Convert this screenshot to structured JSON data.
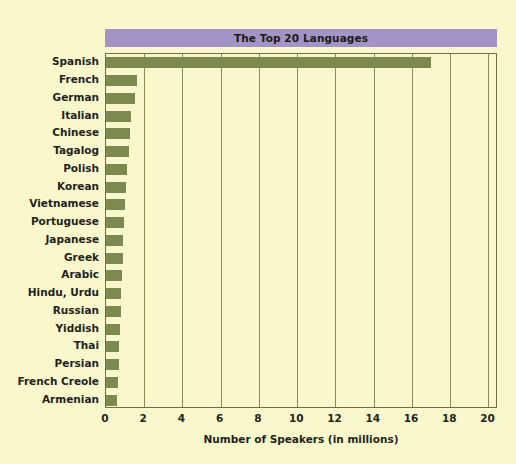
{
  "chart_data": {
    "type": "bar",
    "orientation": "horizontal",
    "title": "The Top 20 Languages",
    "xlabel": "Number of Speakers (in millions)",
    "ylabel": "",
    "xlim": [
      0,
      20.5
    ],
    "xticks": [
      0,
      2,
      4,
      6,
      8,
      10,
      12,
      14,
      16,
      18,
      20
    ],
    "xtick_labels": [
      "0",
      "2",
      "4",
      "6",
      "8",
      "10",
      "12",
      "14",
      "16",
      "18",
      "20"
    ],
    "grid": "vertical",
    "legend": "none",
    "categories": [
      "Spanish",
      "French",
      "German",
      "Italian",
      "Chinese",
      "Tagalog",
      "Polish",
      "Korean",
      "Vietnamese",
      "Portuguese",
      "Japanese",
      "Greek",
      "Arabic",
      "Hindu, Urdu",
      "Russian",
      "Yiddish",
      "Thai",
      "Persian",
      "French Creole",
      "Armenian"
    ],
    "values": [
      17.0,
      1.6,
      1.5,
      1.3,
      1.25,
      1.2,
      1.1,
      1.05,
      1.0,
      0.95,
      0.9,
      0.9,
      0.85,
      0.8,
      0.8,
      0.75,
      0.7,
      0.7,
      0.65,
      0.6
    ],
    "colors": {
      "background": "#f9f8cd",
      "bar": "#7d8a4f",
      "title_banner": "#a294c4",
      "frame": "#6f7043",
      "gridline": "#8a8a58",
      "text": "#231f1a"
    }
  }
}
